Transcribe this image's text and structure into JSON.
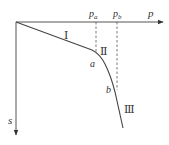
{
  "diagram": {
    "type": "load-settlement curve (p-s curve)",
    "colors": {
      "axis": "#555555",
      "curve": "#444444",
      "dashed": "#555555",
      "text": "#333333"
    },
    "axes": {
      "x_label": "p",
      "y_label": "s",
      "origin": [
        16,
        22
      ],
      "x_end": [
        163,
        22
      ],
      "y_end": [
        16,
        135
      ]
    },
    "markers": [
      {
        "id": "pa",
        "label_main": "p",
        "label_sub": "a",
        "x": 96,
        "y_top": 22,
        "y_bottom": 52
      },
      {
        "id": "pb",
        "label_main": "p",
        "label_sub": "b",
        "x": 117,
        "y_top": 22,
        "y_bottom": 90
      }
    ],
    "points": [
      {
        "label": "a",
        "x": 95,
        "y": 52
      },
      {
        "label": "b",
        "x": 114,
        "y": 88
      }
    ],
    "stages": [
      {
        "label": "Ⅰ",
        "x": 68,
        "y": 38
      },
      {
        "label": "Ⅱ",
        "x": 103,
        "y": 52
      },
      {
        "label": "Ⅲ",
        "x": 128,
        "y": 110
      }
    ],
    "curve_path": "M16,22 L92,50 Q100,54 105,64 Q111,76 115,92 L123,128"
  }
}
